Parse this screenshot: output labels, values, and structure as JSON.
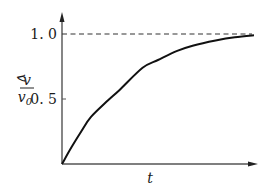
{
  "chart_data": {
    "type": "line",
    "title": "",
    "xlabel": "t",
    "ylabel": "v/v0",
    "ylabel_parts": {
      "numerator": "v",
      "denominator": "v",
      "denominator_subscript": "0"
    },
    "yticks": [
      {
        "value": 0.5,
        "label": "0. 5"
      },
      {
        "value": 1.0,
        "label": "1. 0"
      }
    ],
    "xticks": [],
    "ylim": [
      0,
      1.05
    ],
    "xlim": [
      0,
      1
    ],
    "grid": false,
    "asymptote": {
      "y": 1.0,
      "style": "dashed"
    },
    "series": [
      {
        "name": "v/v0",
        "x": [
          0,
          0.05,
          0.1,
          0.15,
          0.24,
          0.3,
          0.42,
          0.5,
          0.6,
          0.68,
          0.8,
          0.9,
          1.0
        ],
        "y": [
          0,
          0.13,
          0.25,
          0.36,
          0.49,
          0.57,
          0.74,
          0.8,
          0.87,
          0.91,
          0.95,
          0.975,
          0.99
        ]
      }
    ]
  },
  "labels": {
    "y_tick_1": "1. 0",
    "y_tick_05": "0. 5",
    "x_axis": "t",
    "y_num": "v",
    "y_den": "v",
    "y_den_sub": "0"
  }
}
